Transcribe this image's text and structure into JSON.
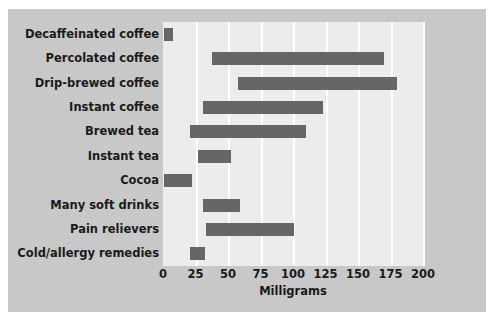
{
  "chart_data": {
    "type": "bar",
    "subtype": "floating-range-bar",
    "title": "",
    "xlabel": "Milligrams",
    "ylabel": "",
    "xlim": [
      0,
      200
    ],
    "xticks": [
      0,
      25,
      50,
      75,
      100,
      125,
      150,
      175,
      200
    ],
    "xtick_labels": [
      "0",
      "25",
      "50",
      "75",
      "100",
      "125",
      "150",
      "175",
      "200"
    ],
    "grid": true,
    "grid_axis": "x",
    "legend": false,
    "orientation": "horizontal",
    "categories": [
      "Decaffeinated coffee",
      "Percolated coffee",
      "Drip-brewed coffee",
      "Instant coffee",
      "Brewed tea",
      "Instant tea",
      "Cocoa",
      "Many soft drinks",
      "Pain relievers",
      "Cold/allergy remedies"
    ],
    "ranges": [
      {
        "category": "Decaffeinated coffee",
        "low": 1,
        "high": 8
      },
      {
        "category": "Percolated coffee",
        "low": 38,
        "high": 170
      },
      {
        "category": "Drip-brewed coffee",
        "low": 58,
        "high": 180
      },
      {
        "category": "Instant coffee",
        "low": 31,
        "high": 123
      },
      {
        "category": "Brewed tea",
        "low": 21,
        "high": 110
      },
      {
        "category": "Instant tea",
        "low": 27,
        "high": 52
      },
      {
        "category": "Cocoa",
        "low": 1,
        "high": 22
      },
      {
        "category": "Many soft drinks",
        "low": 31,
        "high": 59
      },
      {
        "category": "Pain relievers",
        "low": 33,
        "high": 101
      },
      {
        "category": "Cold/allergy remedies",
        "low": 21,
        "high": 32
      }
    ],
    "colors": {
      "bar": "#666666",
      "plot_background": "#ececec",
      "figure_background": "#c8c8c8",
      "gridline": "#ffffff",
      "text": "#1a1a1a",
      "page_background": "#ffffff"
    }
  }
}
